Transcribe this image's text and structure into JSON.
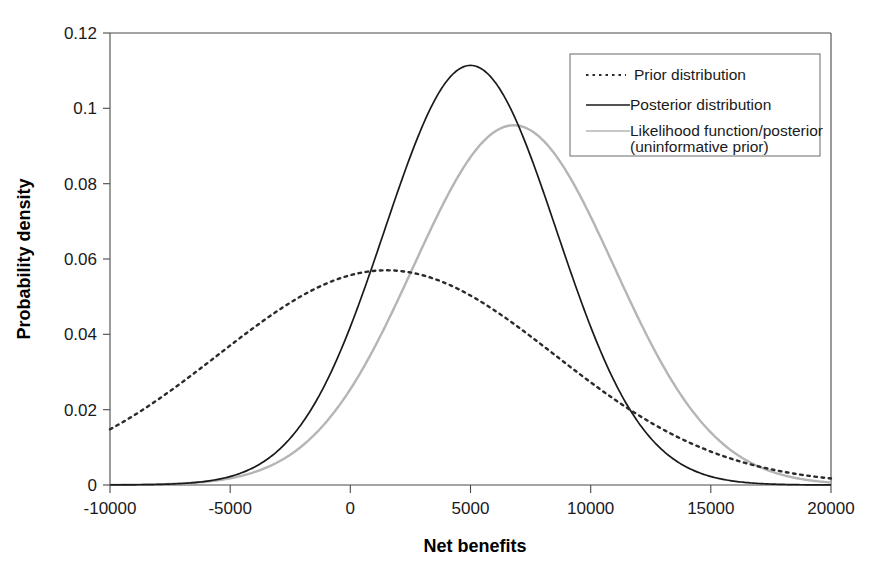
{
  "chart_data": {
    "type": "line",
    "title": "",
    "xlabel": "Net benefits",
    "ylabel": "Probability density",
    "xlim": [
      -10000,
      20000
    ],
    "ylim": [
      0,
      0.12
    ],
    "grid": false,
    "legend_position": "top-right",
    "x_ticks": [
      "-10000",
      "-5000",
      "0",
      "5000",
      "10000",
      "15000",
      "20000"
    ],
    "x_tick_values": [
      -10000,
      -5000,
      0,
      5000,
      10000,
      15000,
      20000
    ],
    "y_ticks": [
      "0",
      "0.02",
      "0.04",
      "0.06",
      "0.08",
      "0.1",
      "0.12"
    ],
    "y_tick_values": [
      0,
      0.02,
      0.04,
      0.06,
      0.08,
      0.1,
      0.12
    ],
    "series": [
      {
        "name": "Prior distribution",
        "style": "dotted",
        "color": "#2b2b2b",
        "mean": 1500,
        "sd": 7000,
        "peak": 0.057,
        "x": [
          -10000,
          -9000,
          -8000,
          -7000,
          -6000,
          -5000,
          -4000,
          -3000,
          -2000,
          -1000,
          0,
          1000,
          1500,
          2000,
          3000,
          4000,
          5000,
          6000,
          7000,
          8000,
          9000,
          10000,
          11000,
          12000,
          13000,
          14000,
          15000,
          16000,
          17000,
          18000,
          19000,
          20000
        ],
        "values": [
          0.0141,
          0.0163,
          0.0186,
          0.0211,
          0.0238,
          0.0266,
          0.0295,
          0.0325,
          0.0355,
          0.0385,
          0.0414,
          0.0441,
          0.0453,
          0.0465,
          0.0486,
          0.0502,
          0.0512,
          0.0517,
          0.0514,
          0.0506,
          0.0491,
          0.0471,
          0.0447,
          0.0419,
          0.0388,
          0.0355,
          0.0321,
          0.0287,
          0.0253,
          0.0221,
          0.019,
          0.0161
        ]
      },
      {
        "name": "Posterior distribution",
        "style": "solid",
        "color": "#1a1a1a",
        "mean": 5000,
        "sd": 3580,
        "peak": 0.1114,
        "x": [
          -10000,
          -8000,
          -6000,
          -5000,
          -4000,
          -3000,
          -2000,
          -1000,
          0,
          1000,
          2000,
          3000,
          4000,
          5000,
          6000,
          7000,
          8000,
          9000,
          10000,
          11000,
          12000,
          13000,
          14000,
          15000,
          16000,
          18000,
          20000
        ],
        "values": [
          2e-05,
          0.00016,
          0.00094,
          0.00197,
          0.00379,
          0.00672,
          0.01097,
          0.01651,
          0.02292,
          0.02937,
          0.03478,
          0.03803,
          0.03831,
          0.0357,
          0.0309,
          0.02476,
          0.01835,
          0.01256,
          0.00794,
          0.00464,
          0.0025,
          0.00124,
          0.00057,
          0.00024,
          9e-05,
          1e-05,
          0.0
        ]
      },
      {
        "name": "Likelihood function/posterior\n(uninformative prior)",
        "label_line1": "Likelihood function/posterior",
        "label_line2": "(uninformative prior)",
        "style": "solid",
        "color": "#b5b5b5",
        "mean": 6800,
        "sd": 4180,
        "peak": 0.0955,
        "x": [
          -10000,
          -8000,
          -6000,
          -5000,
          -4000,
          -3000,
          -2000,
          -1000,
          0,
          1000,
          2000,
          3000,
          4000,
          5000,
          6000,
          6800,
          8000,
          9000,
          10000,
          11000,
          12000,
          13000,
          14000,
          15000,
          16000,
          17000,
          18000,
          19000,
          20000
        ],
        "values": [
          1e-05,
          6e-05,
          0.00026,
          0.00049,
          0.00089,
          0.00153,
          0.00252,
          0.00397,
          0.006,
          0.00869,
          0.01203,
          0.01588,
          0.01993,
          0.02375,
          0.02683,
          0.0283,
          0.02739,
          0.02505,
          0.0218,
          0.01807,
          0.01424,
          0.01068,
          0.00762,
          0.00518,
          0.00335,
          0.00206,
          0.00121,
          0.00067,
          0.00036
        ]
      }
    ]
  },
  "legend": {
    "items": [
      {
        "label": "Prior distribution",
        "swatch": "dotted-line-swatch"
      },
      {
        "label": "Posterior distribution",
        "swatch": "solid-dark-line-swatch"
      },
      {
        "label": "Likelihood function/posterior",
        "label2": "(uninformative prior)",
        "swatch": "solid-gray-line-swatch"
      }
    ]
  },
  "axes": {
    "x_title": "Net benefits",
    "y_title": "Probability density",
    "x_tick_labels": [
      "-10000",
      "-5000",
      "0",
      "5000",
      "10000",
      "15000",
      "20000"
    ],
    "y_tick_labels": [
      "0.12",
      "0.1",
      "0.08",
      "0.06",
      "0.04",
      "0.02",
      "0"
    ]
  },
  "colors": {
    "prior": "#2b2b2b",
    "posterior": "#1a1a1a",
    "likelihood": "#b5b5b5",
    "axis": "#4a4a4a",
    "background": "#ffffff"
  }
}
